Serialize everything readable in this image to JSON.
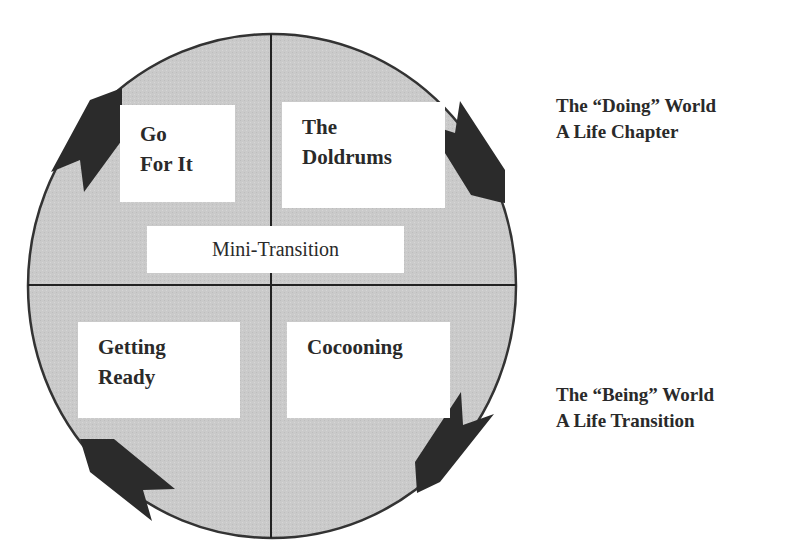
{
  "diagram": {
    "quadrants": {
      "top_left": {
        "lines": [
          "Go",
          "For It"
        ]
      },
      "top_right": {
        "lines": [
          "The",
          "Doldrums"
        ]
      },
      "bottom_left": {
        "lines": [
          "Getting",
          "Ready"
        ]
      },
      "bottom_right": {
        "lines": [
          "Cocooning"
        ]
      }
    },
    "center_label": "Mini-Transition",
    "side_labels": {
      "upper": {
        "lines": [
          "The “Doing” World",
          "A Life Chapter"
        ]
      },
      "lower": {
        "lines": [
          "The “Being” World",
          "A Life Transition"
        ]
      }
    },
    "arrows": [
      {
        "position": "top-left",
        "direction": "up-right"
      },
      {
        "position": "top-right",
        "direction": "down-right"
      },
      {
        "position": "bottom-right",
        "direction": "down-left"
      },
      {
        "position": "bottom-left",
        "direction": "up-left"
      }
    ],
    "colors": {
      "circle_fill": "#c9c9c9",
      "circle_stroke": "#333333",
      "arrow_fill": "#2b2b2b",
      "box_fill": "#ffffff",
      "text": "#2a2a2a"
    }
  }
}
